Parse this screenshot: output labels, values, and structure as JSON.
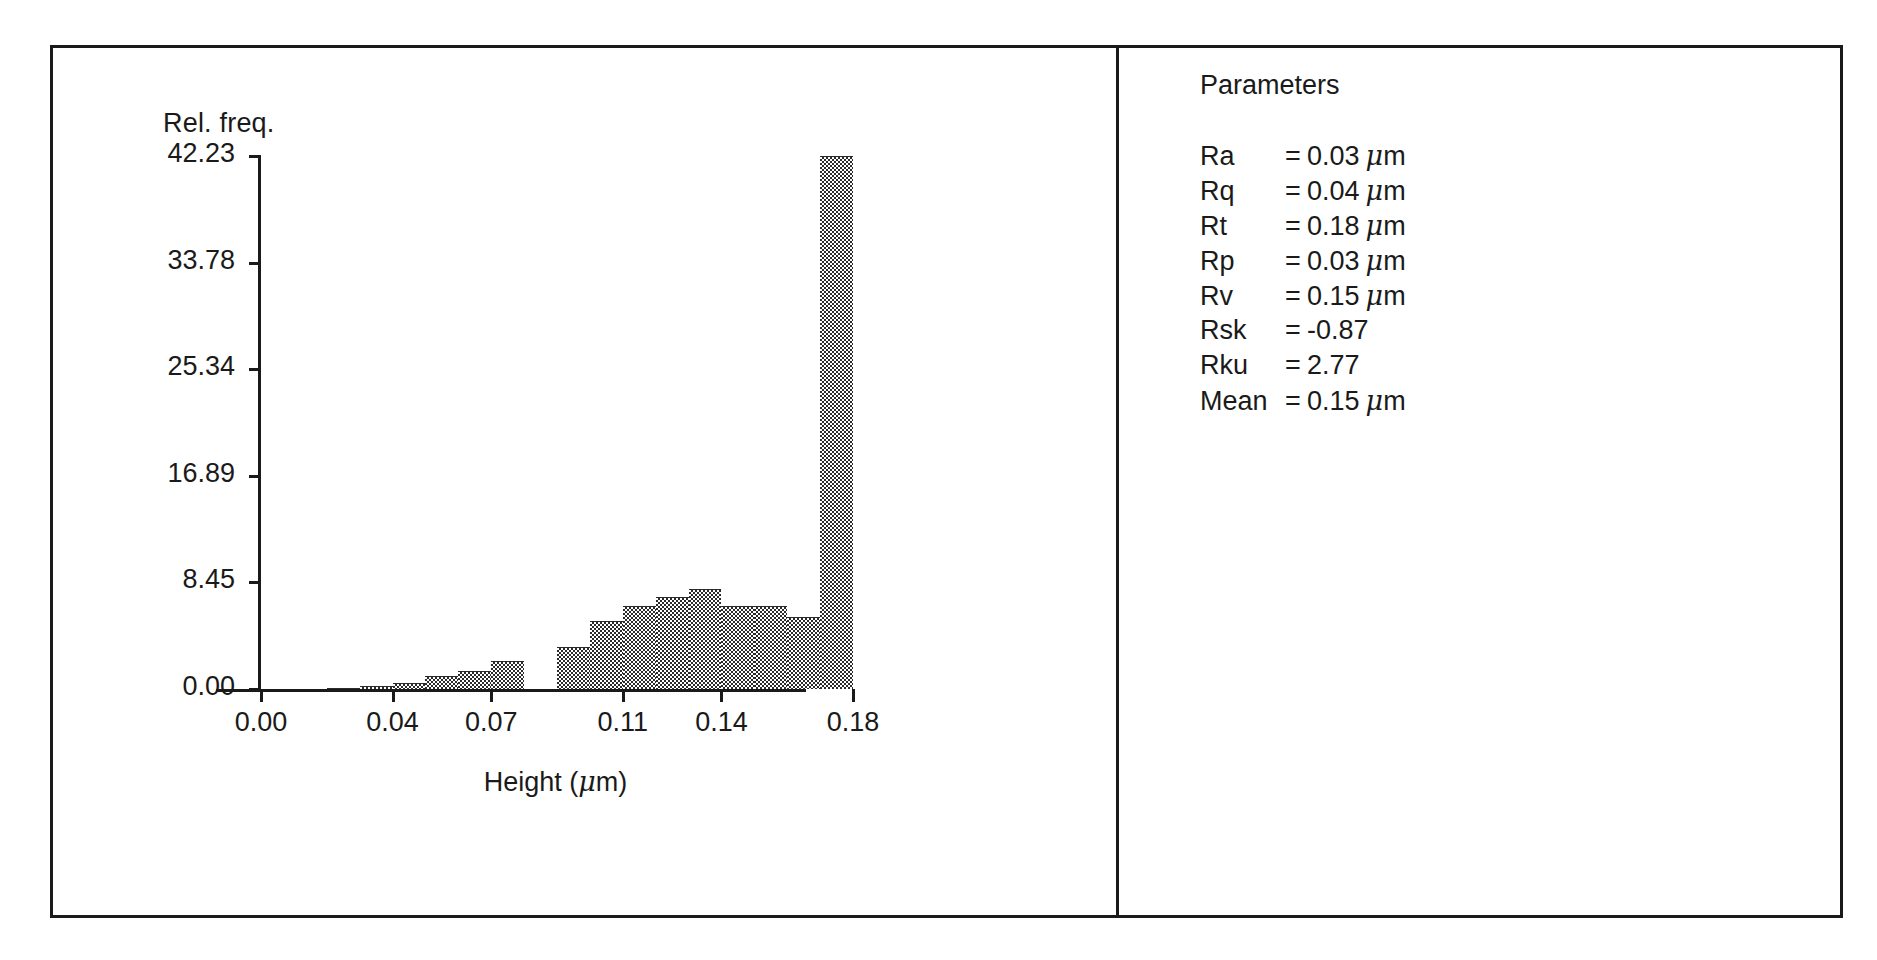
{
  "chart_data": {
    "type": "bar",
    "title": "",
    "subtitle": "",
    "xlabel": "Height (µm)",
    "ylabel": "Rel. freq.",
    "xlabel_text": "Height (",
    "xlabel_unit": "m)",
    "grid": false,
    "legend": "none",
    "xlim": [
      0.0,
      0.18
    ],
    "ylim": [
      0.0,
      42.23
    ],
    "xticks": [
      "0.00",
      "0.04",
      "0.07",
      "0.11",
      "0.14",
      "0.18"
    ],
    "xtick_values": [
      0.0,
      0.04,
      0.07,
      0.11,
      0.14,
      0.18
    ],
    "yticks": [
      "0.00",
      "8.45",
      "16.89",
      "25.34",
      "33.78",
      "42.23"
    ],
    "ytick_values": [
      0.0,
      8.45,
      16.89,
      25.34,
      33.78,
      42.23
    ],
    "bin_width": 0.01,
    "categories": [
      "0.000",
      "0.010",
      "0.020",
      "0.030",
      "0.040",
      "0.050",
      "0.060",
      "0.070",
      "0.080",
      "0.090",
      "0.100",
      "0.110",
      "0.120",
      "0.130",
      "0.140",
      "0.150",
      "0.160",
      "0.170"
    ],
    "bin_starts": [
      0.0,
      0.01,
      0.02,
      0.03,
      0.04,
      0.05,
      0.06,
      0.07,
      0.08,
      0.09,
      0.1,
      0.11,
      0.12,
      0.13,
      0.14,
      0.15,
      0.16,
      0.17
    ],
    "values": [
      0.0,
      0.0,
      0.1,
      0.25,
      0.5,
      1.0,
      1.4,
      2.2,
      0.0,
      3.3,
      5.4,
      6.6,
      7.3,
      7.9,
      6.6,
      6.6,
      5.7,
      42.23
    ],
    "series": [
      {
        "name": "Relative frequency",
        "values": [
          0.0,
          0.0,
          0.1,
          0.25,
          0.5,
          1.0,
          1.4,
          2.2,
          0.0,
          3.3,
          5.4,
          6.6,
          7.3,
          7.9,
          6.6,
          6.6,
          5.7,
          42.23
        ]
      }
    ],
    "max_value": 42.23,
    "fill_pattern": "checkerboard-dither"
  },
  "parameters": {
    "title": "Parameters",
    "rows": [
      {
        "name": "Ra",
        "eq": "=",
        "value": "0.03",
        "unit": "m"
      },
      {
        "name": "Rq",
        "eq": "=",
        "value": "0.04",
        "unit": "m"
      },
      {
        "name": "Rt",
        "eq": "=",
        "value": "0.18",
        "unit": "m"
      },
      {
        "name": "Rp",
        "eq": "=",
        "value": "0.03",
        "unit": "m"
      },
      {
        "name": "Rv",
        "eq": "=",
        "value": "0.15",
        "unit": "m"
      },
      {
        "name": "Rsk",
        "eq": "=",
        "value": "-0.87",
        "unit": ""
      },
      {
        "name": "Rku",
        "eq": "=",
        "value": "2.77",
        "unit": ""
      },
      {
        "name": "Mean",
        "eq": "=",
        "value": "0.15",
        "unit": "m"
      }
    ]
  },
  "colors": {
    "frame": "#1a1a1a",
    "ink": "#1a1a1a",
    "bar": "#2b2b2b",
    "background": "#ffffff"
  }
}
